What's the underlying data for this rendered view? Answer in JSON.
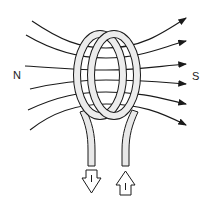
{
  "diagram": {
    "poles": {
      "left": "N",
      "right": "S"
    },
    "current": {
      "out_arrow_label": "I",
      "in_arrow_label": "I"
    },
    "colors": {
      "line": "#1a1a1a",
      "background": "#ffffff",
      "wire_fill": "#e8e8e8"
    }
  }
}
